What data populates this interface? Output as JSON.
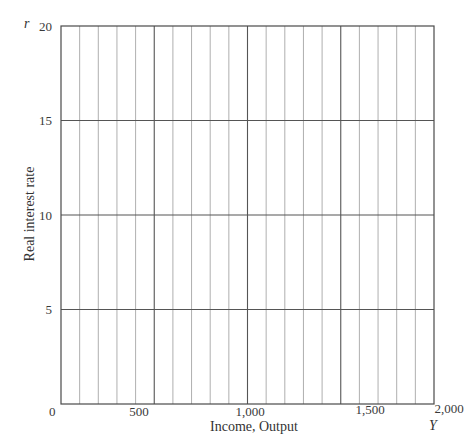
{
  "chart_data": {
    "type": "line",
    "title": "",
    "xlabel": "Income, Output",
    "ylabel": "Real interest rate",
    "x_variable": "Y",
    "y_variable": "r",
    "xlim": [
      0,
      2000
    ],
    "ylim": [
      0,
      20
    ],
    "x_ticks": [
      0,
      500,
      1000,
      1500,
      2000
    ],
    "x_tick_labels": [
      "0",
      "500",
      "1,000",
      "1,500",
      "2,000"
    ],
    "y_ticks": [
      5,
      10,
      15,
      20
    ],
    "y_tick_labels": [
      "5",
      "10",
      "15",
      "20"
    ],
    "grid": {
      "vertical_minor_step": 100,
      "vertical_major_step": 500,
      "horizontal_step": 5
    },
    "series": [],
    "note": "Blank grid for plotting (IS-LM style axes); no data plotted"
  },
  "labels": {
    "y_var": "r",
    "x_var": "Y",
    "y_title": "Real interest rate",
    "x_title": "Income, Output",
    "y_ticks": [
      "5",
      "10",
      "15",
      "20"
    ],
    "x_ticks": [
      "0",
      "500",
      "1,000",
      "1,500",
      "2,000"
    ]
  },
  "colors": {
    "frame": "#4a4a4a",
    "major_grid": "#555555",
    "minor_grid": "#9a9a9a"
  }
}
